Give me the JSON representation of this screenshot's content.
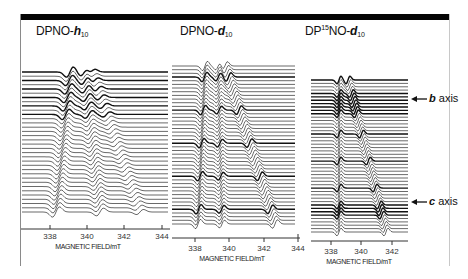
{
  "figure": {
    "panels": [
      {
        "id": "dpno-h10",
        "title_main": "DPNO-",
        "title_italic": "h",
        "title_sub": "10",
        "xlabel": "MAGNETIC FIELD/mT",
        "ticks": [
          "338",
          "340",
          "342",
          "344"
        ]
      },
      {
        "id": "dpno-d10",
        "title_main": "DPNO-",
        "title_italic": "d",
        "title_sub": "10",
        "xlabel": "MAGNETIC FIELD/mT",
        "ticks": [
          "338",
          "340",
          "342",
          "344"
        ]
      },
      {
        "id": "dp15no-d10",
        "title_pre": "DP",
        "title_sup": "15",
        "title_main": "NO-",
        "title_italic": "d",
        "title_sub": "10",
        "xlabel": "MAGNETIC FIELD/mT",
        "ticks": [
          "338",
          "340",
          "342"
        ]
      }
    ],
    "annotations": {
      "b_axis_italic": "b",
      "b_axis_text": " axis",
      "c_axis_italic": "c",
      "c_axis_text": " axis"
    }
  },
  "chart_data": [
    {
      "type": "line",
      "title": "DPNO-h10",
      "xlabel": "MAGNETIC FIELD/mT",
      "ylabel": "",
      "xlim": [
        337,
        344
      ],
      "x_ticks": [
        338,
        340,
        342,
        344
      ],
      "description": "Stacked angular-dependent EPR spectra (waterfall); ~35 traces offset vertically, resonance lines shifting between ~339 and ~342.5 mT with rotation angle",
      "series_count": 35,
      "resonance_positions_mT": {
        "top": [
          339.7,
          340.5
        ],
        "bottom": [
          338.3,
          340.6,
          342.8
        ]
      }
    },
    {
      "type": "line",
      "title": "DPNO-d10",
      "xlabel": "MAGNETIC FIELD/mT",
      "ylabel": "",
      "xlim": [
        337,
        344
      ],
      "x_ticks": [
        338,
        340,
        342,
        344
      ],
      "description": "Stacked angular-dependent EPR spectra; two crossing lines, merging near 339.5 mT at top, splitting to ~338.5 and ~342.5 mT at bottom",
      "series_count": 45,
      "resonance_positions_mT": {
        "top": [
          339.0,
          339.8,
          340.3
        ],
        "bottom": [
          338.6,
          339.6,
          342.4
        ]
      }
    },
    {
      "type": "line",
      "title": "DP15NO-d10",
      "xlabel": "MAGNETIC FIELD/mT",
      "ylabel": "",
      "xlim": [
        337.3,
        343.2
      ],
      "x_ticks": [
        338,
        340,
        342
      ],
      "description": "Stacked angular-dependent EPR spectra from b axis to c axis; line at ~338.5 mT constant, second line moves from ~339.4 mT (b axis) to ~341.6 mT (c axis)",
      "series_count": 45,
      "annotations": [
        "b axis",
        "c axis"
      ],
      "resonance_positions_mT": {
        "b_axis": [
          338.8,
          339.4
        ],
        "c_axis": [
          338.5,
          341.6
        ]
      }
    }
  ]
}
